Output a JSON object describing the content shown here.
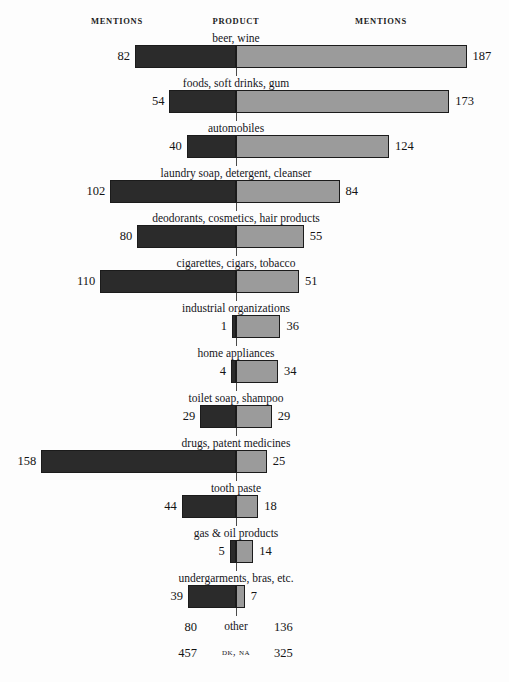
{
  "header": {
    "left_label": "MENTIONS",
    "center_label": "PRODUCT",
    "right_label": "MENTIONS"
  },
  "footer": {
    "other": {
      "label": "other",
      "left": "80",
      "right": "136"
    },
    "dk_na": {
      "label": "DK, NA",
      "left": "457",
      "right": "325"
    }
  },
  "colors": {
    "left_bar": "#2b2b2b",
    "right_bar": "#9b9b9b",
    "bar_outline": "#1b1b1b",
    "background": "#fdfdfd",
    "text": "#141414"
  },
  "chart_data": {
    "type": "bar",
    "title": "",
    "subtitle": "",
    "orientation": "horizontal-diverging",
    "xlabel": "Mentions",
    "ylabel": "Product",
    "center_axis": 0,
    "grid": false,
    "legend_position": "none",
    "axis_max_left": 158,
    "axis_max_right": 187,
    "px_per_unit": 1.233,
    "center_x_px": 236,
    "categories": [
      "beer, wine",
      "foods, soft drinks, gum",
      "automobiles",
      "laundry soap, detergent, cleanser",
      "deodorants, cosmetics, hair products",
      "cigarettes, cigars, tobacco",
      "industrial organizations",
      "home appliances",
      "toilet soap, shampoo",
      "drugs, patent medicines",
      "tooth paste",
      "gas & oil products",
      "undergarments, bras, etc."
    ],
    "series": [
      {
        "name": "MENTIONS (left)",
        "side": "left",
        "color": "#2b2b2b",
        "values": [
          82,
          54,
          40,
          102,
          80,
          110,
          1,
          4,
          29,
          158,
          44,
          5,
          39
        ]
      },
      {
        "name": "MENTIONS (right)",
        "side": "right",
        "color": "#9b9b9b",
        "values": [
          187,
          173,
          124,
          84,
          55,
          51,
          36,
          34,
          29,
          25,
          18,
          14,
          7
        ]
      }
    ],
    "extra_rows": [
      {
        "label": "other",
        "left": 80,
        "right": 136
      },
      {
        "label": "DK, NA",
        "left": 457,
        "right": 325
      }
    ]
  }
}
